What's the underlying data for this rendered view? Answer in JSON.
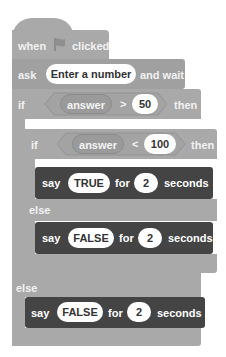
{
  "script": {
    "hat": {
      "when": "when",
      "icon": "green-flag-icon",
      "clicked": "clicked"
    },
    "ask": {
      "label": "ask",
      "prompt": "Enter a number",
      "suffix": "and wait"
    },
    "outer_if": {
      "if_label": "if",
      "condition": {
        "reporter": "answer",
        "operator": ">",
        "value": "50"
      },
      "then_label": "then",
      "else_label": "else"
    },
    "inner_if": {
      "if_label": "if",
      "condition": {
        "reporter": "answer",
        "operator": "<",
        "value": "100"
      },
      "then_label": "then",
      "else_label": "else"
    },
    "say_true": {
      "say": "say",
      "message": "TRUE",
      "for": "for",
      "secs": "2",
      "seconds": "seconds"
    },
    "say_false_inner": {
      "say": "say",
      "message": "FALSE",
      "for": "for",
      "secs": "2",
      "seconds": "seconds"
    },
    "say_false_outer": {
      "say": "say",
      "message": "FALSE",
      "for": "for",
      "secs": "2",
      "seconds": "seconds"
    }
  },
  "colors": {
    "control": "#a9a9a9",
    "looks": "#444444",
    "reporter": "#9a9a9a"
  }
}
